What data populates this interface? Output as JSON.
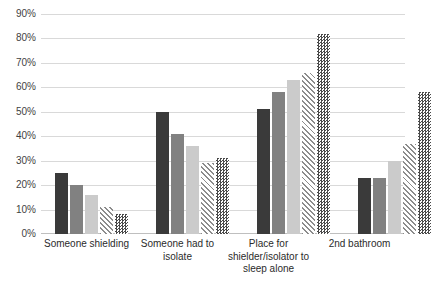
{
  "chart_data": {
    "type": "bar",
    "title": "",
    "xlabel": "",
    "ylabel": "",
    "ylim": [
      0,
      90
    ],
    "grid": true,
    "legend": "none",
    "ytick_labels": [
      "90%",
      "80%",
      "70%",
      "60%",
      "50%",
      "40%",
      "30%",
      "20%",
      "10%",
      "0%"
    ],
    "ytick_values": [
      90,
      80,
      70,
      60,
      50,
      40,
      30,
      20,
      10,
      0
    ],
    "categories": [
      "Someone shielding",
      "Someone had to isolate",
      "Place for shielder/isolator to sleep alone",
      "2nd bathroom"
    ],
    "series": [
      {
        "name": "Series 1",
        "fill": "solid-dark",
        "color": "#3a3a3a",
        "values": [
          25,
          50,
          51,
          23
        ]
      },
      {
        "name": "Series 2",
        "fill": "solid-medium",
        "color": "#818181",
        "values": [
          20,
          41,
          58,
          23
        ]
      },
      {
        "name": "Series 3",
        "fill": "solid-light",
        "color": "#cbcbcb",
        "values": [
          16,
          36,
          63,
          30
        ]
      },
      {
        "name": "Series 4",
        "fill": "diagonal-hatch",
        "color": "#8c8c8c",
        "values": [
          11,
          29,
          66,
          37
        ]
      },
      {
        "name": "Series 5",
        "fill": "checkerboard",
        "color": "#4a4a4a",
        "values": [
          8,
          31,
          82,
          58
        ]
      }
    ]
  },
  "axis": {
    "gridline_color": "#d9d9d9",
    "baseline_color": "#bfbfbf"
  }
}
